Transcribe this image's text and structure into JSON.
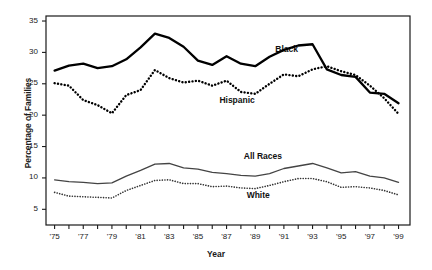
{
  "chart_data": {
    "type": "line",
    "title": "",
    "xlabel": "Year",
    "ylabel": "Percentage of Families",
    "xlim": [
      1974.4,
      1999.8
    ],
    "ylim": [
      2.5,
      35.8
    ],
    "yticks": [
      5,
      10,
      15,
      20,
      25,
      30,
      35
    ],
    "ytick_labels": [
      "5",
      "10",
      "15",
      "20",
      "25",
      "30",
      "35"
    ],
    "xticks": [
      1975,
      1976,
      1977,
      1978,
      1979,
      1980,
      1981,
      1982,
      1983,
      1984,
      1985,
      1986,
      1987,
      1988,
      1989,
      1990,
      1991,
      1992,
      1993,
      1994,
      1995,
      1996,
      1997,
      1998,
      1999
    ],
    "xtick_labels": [
      "'75",
      "",
      "'77",
      "",
      "'79",
      "",
      "'81",
      "",
      "'83",
      "",
      "'85",
      "",
      "'87",
      "",
      "'89",
      "",
      "'91",
      "",
      "'93",
      "",
      "'95",
      "",
      "'97",
      "",
      "'99"
    ],
    "grid": false,
    "legend_position": "inline-annotations",
    "x": [
      1975,
      1976,
      1977,
      1978,
      1979,
      1980,
      1981,
      1982,
      1983,
      1984,
      1985,
      1986,
      1987,
      1988,
      1989,
      1990,
      1991,
      1992,
      1993,
      1994,
      1995,
      1996,
      1997,
      1998,
      1999
    ],
    "series": [
      {
        "name": "Black",
        "style": "solid-thick",
        "color": "#000000",
        "label_x": 1990.4,
        "label_y": 30.4,
        "values": [
          27.1,
          27.9,
          28.2,
          27.5,
          27.8,
          28.9,
          30.8,
          33.0,
          32.3,
          30.9,
          28.7,
          28.0,
          29.4,
          28.2,
          27.8,
          29.3,
          30.4,
          31.1,
          31.3,
          27.3,
          26.4,
          26.1,
          23.6,
          23.4,
          21.9
        ]
      },
      {
        "name": "Hispanic",
        "style": "dotted-thick",
        "color": "#000000",
        "label_x": 1986.5,
        "label_y": 22.3,
        "values": [
          25.1,
          24.7,
          22.4,
          21.6,
          20.3,
          23.2,
          24.0,
          27.2,
          25.9,
          25.2,
          25.5,
          24.7,
          25.5,
          23.7,
          23.4,
          25.0,
          26.5,
          26.2,
          27.3,
          27.8,
          27.0,
          26.4,
          24.7,
          22.7,
          20.2
        ]
      },
      {
        "name": "All Races",
        "style": "solid-thin",
        "color": "#444444",
        "label_x": 1988.2,
        "label_y": 13.4,
        "values": [
          9.7,
          9.4,
          9.3,
          9.1,
          9.2,
          10.3,
          11.2,
          12.2,
          12.3,
          11.6,
          11.4,
          10.9,
          10.7,
          10.4,
          10.3,
          10.7,
          11.5,
          11.9,
          12.3,
          11.6,
          10.8,
          11.0,
          10.3,
          10.0,
          9.3
        ]
      },
      {
        "name": "White",
        "style": "dotted-thin",
        "color": "#333333",
        "label_x": 1988.4,
        "label_y": 7.2,
        "values": [
          7.7,
          7.1,
          7.0,
          6.9,
          6.8,
          8.0,
          8.8,
          9.6,
          9.7,
          9.1,
          9.1,
          8.6,
          8.7,
          8.4,
          8.3,
          8.8,
          9.4,
          9.9,
          9.9,
          9.4,
          8.5,
          8.6,
          8.4,
          8.0,
          7.3
        ]
      }
    ]
  },
  "axis": {
    "ylabel": "Percentage of Families",
    "xlabel": "Year"
  }
}
